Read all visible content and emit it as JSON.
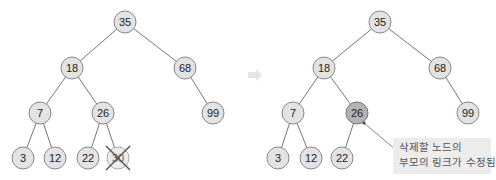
{
  "left_tree": {
    "title": "before-deletion",
    "nodes": [
      {
        "id": "L35",
        "value": "35",
        "x": 125,
        "y": 22
      },
      {
        "id": "L18",
        "value": "18",
        "x": 72,
        "y": 68
      },
      {
        "id": "L68",
        "value": "68",
        "x": 185,
        "y": 68
      },
      {
        "id": "L7",
        "value": "7",
        "x": 40,
        "y": 113
      },
      {
        "id": "L26",
        "value": "26",
        "x": 103,
        "y": 113
      },
      {
        "id": "L99",
        "value": "99",
        "x": 213,
        "y": 113
      },
      {
        "id": "L3",
        "value": "3",
        "x": 23,
        "y": 158
      },
      {
        "id": "L12",
        "value": "12",
        "x": 55,
        "y": 158
      },
      {
        "id": "L22",
        "value": "22",
        "x": 88,
        "y": 158
      },
      {
        "id": "L30",
        "value": "30",
        "x": 118,
        "y": 158,
        "deleted": true
      }
    ],
    "edges": [
      [
        "L35",
        "L18"
      ],
      [
        "L35",
        "L68"
      ],
      [
        "L18",
        "L7"
      ],
      [
        "L18",
        "L26"
      ],
      [
        "L68",
        "L99"
      ],
      [
        "L7",
        "L3"
      ],
      [
        "L7",
        "L12"
      ],
      [
        "L26",
        "L22"
      ],
      [
        "L26",
        "L30"
      ]
    ]
  },
  "arrow": {
    "direction": "right",
    "color": "#e6e6e6"
  },
  "right_tree": {
    "title": "after-deletion",
    "nodes": [
      {
        "id": "R35",
        "value": "35",
        "x": 380,
        "y": 22
      },
      {
        "id": "R18",
        "value": "18",
        "x": 324,
        "y": 68
      },
      {
        "id": "R68",
        "value": "68",
        "x": 440,
        "y": 68
      },
      {
        "id": "R7",
        "value": "7",
        "x": 293,
        "y": 113
      },
      {
        "id": "R26",
        "value": "26",
        "x": 357,
        "y": 113,
        "highlighted": true
      },
      {
        "id": "R99",
        "value": "99",
        "x": 468,
        "y": 113
      },
      {
        "id": "R3",
        "value": "3",
        "x": 278,
        "y": 158
      },
      {
        "id": "R12",
        "value": "12",
        "x": 311,
        "y": 158
      },
      {
        "id": "R22",
        "value": "22",
        "x": 342,
        "y": 158
      }
    ],
    "edges": [
      [
        "R35",
        "R18"
      ],
      [
        "R35",
        "R68"
      ],
      [
        "R18",
        "R7"
      ],
      [
        "R18",
        "R26"
      ],
      [
        "R68",
        "R99"
      ],
      [
        "R7",
        "R3"
      ],
      [
        "R7",
        "R12"
      ],
      [
        "R26",
        "R22"
      ]
    ]
  },
  "callout": {
    "line1": "삭제할 노드의",
    "line2": "부모의 링크가 수정됨",
    "target": "R26"
  }
}
